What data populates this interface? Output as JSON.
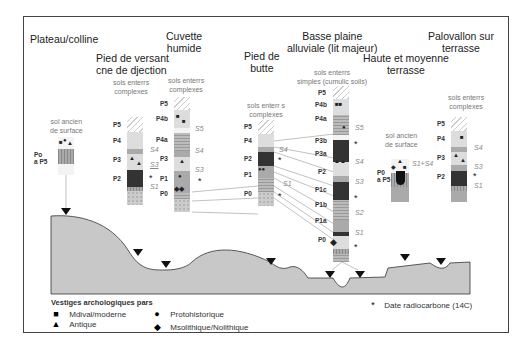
{
  "landscape_units": [
    {
      "id": "plateau",
      "title": "Plateau/colline"
    },
    {
      "id": "pied_versant",
      "title": "Pied de versant\ncne de djection"
    },
    {
      "id": "cuvette",
      "title": "Cuvette\nhumide"
    },
    {
      "id": "pied_butte",
      "title": "Pied de\nbutte"
    },
    {
      "id": "basse_plaine",
      "title": "Basse plaine\nalluviale (lit majeur)"
    },
    {
      "id": "haute_terrasse",
      "title": "Haute et moyenne\nterrasse"
    },
    {
      "id": "palovallon",
      "title": "Palovallon sur\nterrasse"
    }
  ],
  "sub_labels": {
    "plateau": "sol ancien\nde surface",
    "pied_versant": "sols enterrs\ncomplexes",
    "cuvette": "sols enterrs\ncomplexes",
    "pied_butte": "sols enterr s\ncomplexes",
    "basse_plaine": "sols enterrs\nsimples (cumulic soils)",
    "haute_terrasse": "sol ancien\nde surface",
    "palovallon": "sols enterrs\ncomplexes"
  },
  "columns": {
    "plateau": {
      "range_label": "Po\na P5"
    },
    "pied_versant": {
      "layers": [
        "P5",
        "P4",
        "P3",
        "P2"
      ],
      "soils": [
        "S4",
        "S3",
        "S1"
      ]
    },
    "cuvette": {
      "layers": [
        "P5",
        "P4b",
        "P4a",
        "P3",
        "P1",
        "P0"
      ],
      "soils": [
        "S5",
        "S4",
        "S3"
      ]
    },
    "pied_butte": {
      "layers": [
        "P5",
        "P4",
        "P2",
        "P1",
        "P0"
      ],
      "soils": [
        "S4",
        "S1"
      ]
    },
    "basse_plaine": {
      "layers": [
        "P5",
        "P4b",
        "P4a",
        "P3b",
        "P3a",
        "P2",
        "P1c",
        "P1b",
        "P1a",
        "P0"
      ],
      "soils": [
        "S5",
        "S4",
        "S3",
        "S2",
        "S1"
      ]
    },
    "haute_terrasse": {
      "range_label": "P0\na P5",
      "soils": [
        "S1+S4"
      ]
    },
    "palovallon": {
      "layers": [
        "P5",
        "P4",
        "P3",
        "P2"
      ],
      "soils": [
        "S4",
        "S3",
        "S1"
      ]
    }
  },
  "legend": {
    "title": "Vestiges archologiques pars",
    "items": [
      {
        "symbol": "■",
        "label": "Mdival/moderne",
        "icon": "square-icon"
      },
      {
        "symbol": "▲",
        "label": "Antique",
        "icon": "triangle-icon"
      },
      {
        "symbol": "●",
        "label": "Protohistorique",
        "icon": "circle-icon"
      },
      {
        "symbol": "◆",
        "label": "Msolithique/Nolithique",
        "icon": "diamond-icon"
      }
    ],
    "radiocarbon": {
      "symbol": "*",
      "label": "Date radiocarbone (14C)"
    }
  },
  "colors": {
    "terrain": "#c8c8c8",
    "frame": "#444444",
    "dark_layer": "#333333"
  }
}
